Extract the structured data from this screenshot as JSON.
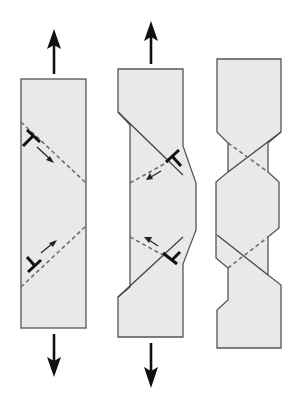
{
  "figure": {
    "colors": {
      "specimen_fill": "#e9e9e9",
      "specimen_outline": "#555555",
      "slip_line": "#6e6e6e",
      "arrow": "#111111"
    },
    "panels": [
      {
        "id": "undeformed",
        "label": "",
        "load_arrows": [
          "up",
          "down"
        ],
        "slip_planes": 2,
        "dislocations": 2
      },
      {
        "id": "partially-slipped",
        "label": "",
        "load_arrows": [
          "up",
          "down"
        ],
        "slip_planes": 2,
        "dislocations": 2
      },
      {
        "id": "slipped-necked",
        "label": "",
        "load_arrows": [],
        "slip_planes": 2,
        "dislocations": 0
      }
    ]
  }
}
